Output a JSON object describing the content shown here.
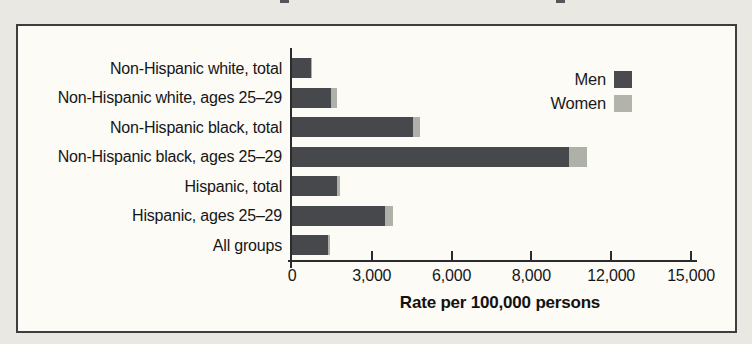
{
  "page": {
    "background_color": "#e9e8e3",
    "panel_background_color": "#fcfbf6",
    "panel_border_color": "#3d3e40",
    "axis_color": "#2b2c2e",
    "text_color": "#161616"
  },
  "legend": {
    "items": [
      {
        "label": "Men",
        "color": "#4a4b4e"
      },
      {
        "label": "Women",
        "color": "#b2b4ab"
      }
    ]
  },
  "chart_data": {
    "type": "bar",
    "orientation": "horizontal",
    "stacked": true,
    "title": "",
    "xlabel": "Rate per 100,000 persons",
    "ylabel": "",
    "xlim": [
      0,
      15000
    ],
    "grid": false,
    "legend_position": "top-right",
    "categories": [
      "Non-Hispanic white, total",
      "Non-Hispanic white, ages 25–29",
      "Non-Hispanic black, total",
      "Non-Hispanic black, ages 25–29",
      "Hispanic, total",
      "Hispanic, ages 25–29",
      "All groups"
    ],
    "series": [
      {
        "name": "Men",
        "color": "#47484b",
        "values": [
          710,
          1450,
          4550,
          10400,
          1700,
          3500,
          1350
        ]
      },
      {
        "name": "Women",
        "color": "#aeb1a8",
        "values": [
          60,
          230,
          270,
          700,
          100,
          300,
          60
        ]
      }
    ],
    "xticks": [
      {
        "value": 0,
        "label": "0"
      },
      {
        "value": 3000,
        "label": "3,000"
      },
      {
        "value": 6000,
        "label": "6,000"
      },
      {
        "value": 9000,
        "label": "8,000"
      },
      {
        "value": 12000,
        "label": "12,000"
      },
      {
        "value": 15000,
        "label": "15,000"
      }
    ]
  }
}
